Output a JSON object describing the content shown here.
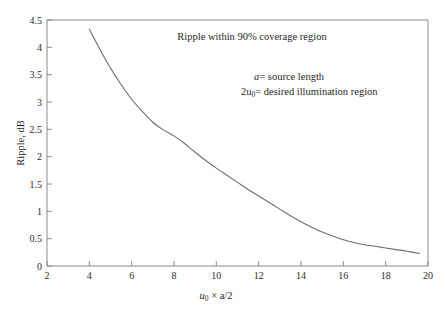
{
  "chart_data": {
    "type": "line",
    "title": "",
    "xlabel": "u0 × a/2",
    "ylabel": "Ripple, dB",
    "xlim": [
      2,
      20
    ],
    "ylim": [
      0,
      4.5
    ],
    "grid": false,
    "legend": "none",
    "xticks": [
      2,
      4,
      6,
      8,
      10,
      12,
      14,
      16,
      18,
      20
    ],
    "xtick_labels": [
      "2",
      "4",
      "6",
      "8",
      "10",
      "12",
      "14",
      "16",
      "18",
      "20"
    ],
    "yticks": [
      0,
      0.5,
      1,
      1.5,
      2,
      2.5,
      3,
      3.5,
      4,
      4.5
    ],
    "ytick_labels": [
      "0",
      "0.5",
      "1",
      "1.5",
      "2",
      "2.5",
      "3",
      "3.5",
      "4",
      "4.5"
    ],
    "series": [
      {
        "name": "Ripple",
        "x": [
          4.0,
          4.5,
          5.0,
          5.5,
          6.0,
          6.5,
          7.0,
          7.5,
          8.0,
          8.5,
          9.0,
          9.5,
          10.0,
          10.5,
          11.0,
          11.5,
          12.0,
          12.5,
          13.0,
          13.5,
          14.0,
          14.5,
          15.0,
          15.5,
          16.0,
          16.5,
          17.0,
          17.5,
          18.0,
          18.5,
          19.0,
          19.6
        ],
        "y": [
          4.33,
          3.96,
          3.62,
          3.32,
          3.05,
          2.83,
          2.63,
          2.49,
          2.38,
          2.24,
          2.08,
          1.93,
          1.79,
          1.66,
          1.53,
          1.4,
          1.28,
          1.16,
          1.04,
          0.92,
          0.81,
          0.71,
          0.62,
          0.55,
          0.48,
          0.43,
          0.39,
          0.36,
          0.33,
          0.3,
          0.27,
          0.23
        ]
      }
    ],
    "annotations": [
      {
        "id": "coverage-note",
        "text": "Ripple within 90% coverage region",
        "x": 9.7,
        "y": 4.1
      },
      {
        "id": "source-length-note",
        "text": "a = source length",
        "x": 12.1,
        "y": 3.37
      },
      {
        "id": "illumination-note",
        "text": "2u0 = desired illumination region",
        "x": 12.1,
        "y": 3.05
      }
    ]
  },
  "axis_labels": {
    "x_title_main": "× a/2",
    "x_title_var": "u",
    "x_title_sub": "0",
    "y_title": "Ripple, dB"
  },
  "annotations_parts": {
    "coverage": "Ripple within 90% coverage region",
    "source_var": "a",
    "source_rest": "= source length",
    "illum_prefix": "2u",
    "illum_sub": "0",
    "illum_rest": "= desired illumination region"
  },
  "colors": {
    "curve": "#6e6e6e",
    "axis": "#8a8a8a",
    "text": "#1f1f1f",
    "background": "#ffffff"
  }
}
